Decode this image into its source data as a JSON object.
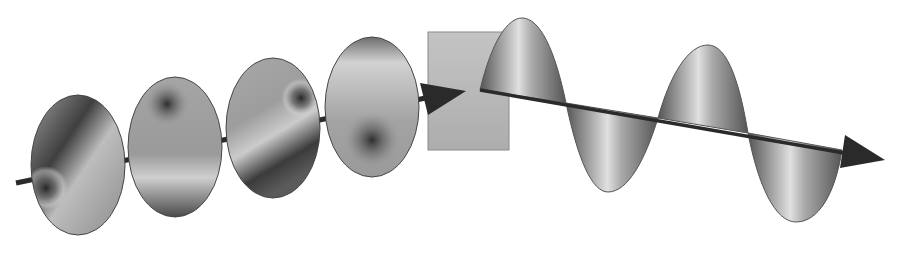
{
  "diagram": {
    "type": "polarization-illustration",
    "colors": {
      "background": "#ffffff",
      "axis": "#2a2a2a",
      "disk_mid": "#9a9a9a",
      "disk_dark": "#3c3c3c",
      "disk_light": "#cfcfcf",
      "filter_fill": "#b9b9b9",
      "filter_stroke": "#8a8a8a",
      "wave_dark": "#5a5a5a",
      "wave_light": "#d8d8d8"
    },
    "input_disks": [
      {
        "cx": 78,
        "cy": 165,
        "spot_x": 46,
        "spot_y": 188,
        "dark_side": "top-right"
      },
      {
        "cx": 175,
        "cy": 147,
        "spot_x": 167,
        "spot_y": 104,
        "dark_side": "bottom"
      },
      {
        "cx": 273,
        "cy": 128,
        "spot_x": 301,
        "spot_y": 98,
        "dark_side": "bottom-left"
      },
      {
        "cx": 372,
        "cy": 107,
        "spot_x": 372,
        "spot_y": 140,
        "dark_side": "top"
      }
    ],
    "filter": {
      "x": 428,
      "y": 32,
      "width": 81,
      "height": 118
    },
    "output_wave": {
      "x_start": 480,
      "y_start": 90,
      "x_end": 885,
      "y_end": 160,
      "cycles": 2
    }
  }
}
